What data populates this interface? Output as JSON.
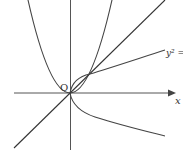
{
  "diagram": {
    "type": "function-graph",
    "origin_label": "O",
    "x_axis_label": "x",
    "curves": [
      {
        "name": "parabola-y-equals-x-squared",
        "equation": "y = x^2"
      },
      {
        "name": "line-y-equals-x",
        "equation": "y = x"
      },
      {
        "name": "sideways-parabola",
        "equation": "y^2 = x",
        "label": "y² ="
      }
    ],
    "colors": {
      "stroke": "#444444",
      "axis": "#555555",
      "background": "#ffffff"
    }
  }
}
